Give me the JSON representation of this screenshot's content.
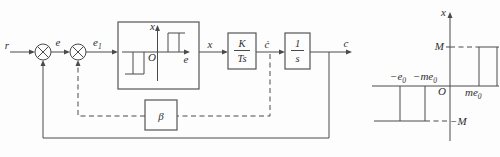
{
  "block_diagram": {
    "input_label": "r",
    "error_label": "e",
    "e1": {
      "base": "e",
      "sub": "1"
    },
    "nl_output_label": "x",
    "cdot_label": "ċ",
    "output_label": "c",
    "gain_block": {
      "numerator": "K",
      "denominator": "Ts"
    },
    "integrator_block": {
      "numerator": "1",
      "denominator": "s"
    },
    "beta_label": "β",
    "nl_inset": {
      "vaxis": "x",
      "haxis": "e",
      "origin": "O"
    }
  },
  "characteristic_plot": {
    "vaxis": "x",
    "origin": "O",
    "upper_level": "M",
    "lower_level": "−M",
    "neg_e0": {
      "base": "−e",
      "sub": "0"
    },
    "neg_me0": {
      "base": "−me",
      "sub": "0"
    },
    "me0": {
      "base": "me",
      "sub": "0"
    }
  }
}
